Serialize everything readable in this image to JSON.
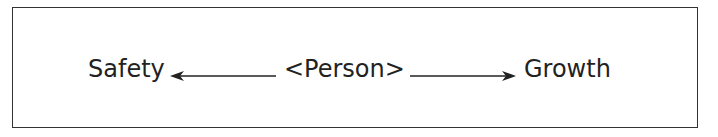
{
  "diagram": {
    "left_label": "Safety",
    "center_label": "<Person>",
    "right_label": "Growth",
    "arrows": [
      {
        "from": "<Person>",
        "to": "Safety",
        "direction": "left"
      },
      {
        "from": "<Person>",
        "to": "Growth",
        "direction": "right"
      }
    ],
    "colors": {
      "line": "#222222",
      "border": "#333333",
      "background": "#ffffff"
    }
  }
}
